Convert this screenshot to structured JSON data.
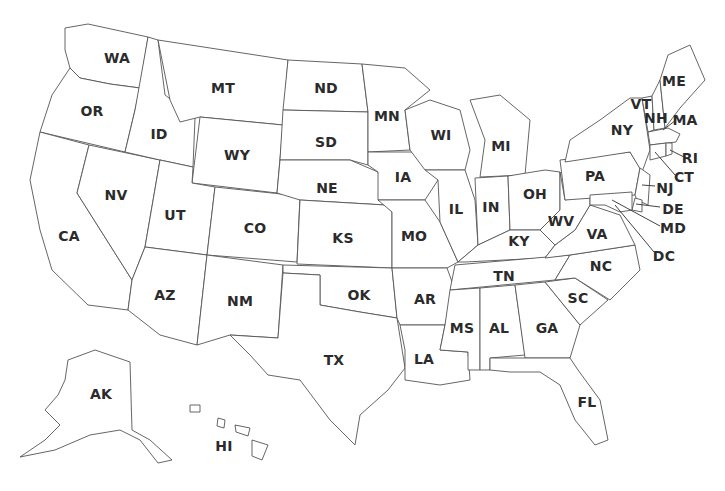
{
  "map": {
    "title": "United States",
    "colors": {
      "fill": "#ffffff",
      "stroke": "#555555",
      "label": "#2b2b2b"
    },
    "states": [
      {
        "abbr": "WA",
        "x": 117,
        "y": 58
      },
      {
        "abbr": "OR",
        "x": 92,
        "y": 111
      },
      {
        "abbr": "CA",
        "x": 69,
        "y": 236
      },
      {
        "abbr": "NV",
        "x": 116,
        "y": 195
      },
      {
        "abbr": "ID",
        "x": 159,
        "y": 134
      },
      {
        "abbr": "MT",
        "x": 223,
        "y": 88
      },
      {
        "abbr": "WY",
        "x": 237,
        "y": 155
      },
      {
        "abbr": "UT",
        "x": 175,
        "y": 215
      },
      {
        "abbr": "CO",
        "x": 255,
        "y": 228
      },
      {
        "abbr": "AZ",
        "x": 165,
        "y": 295
      },
      {
        "abbr": "NM",
        "x": 240,
        "y": 301
      },
      {
        "abbr": "ND",
        "x": 326,
        "y": 88
      },
      {
        "abbr": "SD",
        "x": 326,
        "y": 142
      },
      {
        "abbr": "NE",
        "x": 327,
        "y": 188
      },
      {
        "abbr": "KS",
        "x": 343,
        "y": 238
      },
      {
        "abbr": "OK",
        "x": 359,
        "y": 295
      },
      {
        "abbr": "TX",
        "x": 334,
        "y": 360
      },
      {
        "abbr": "MN",
        "x": 387,
        "y": 116
      },
      {
        "abbr": "IA",
        "x": 403,
        "y": 177
      },
      {
        "abbr": "MO",
        "x": 414,
        "y": 236
      },
      {
        "abbr": "AR",
        "x": 425,
        "y": 299
      },
      {
        "abbr": "LA",
        "x": 424,
        "y": 359
      },
      {
        "abbr": "WI",
        "x": 441,
        "y": 135
      },
      {
        "abbr": "IL",
        "x": 456,
        "y": 209
      },
      {
        "abbr": "MI",
        "x": 501,
        "y": 146
      },
      {
        "abbr": "IN",
        "x": 491,
        "y": 207
      },
      {
        "abbr": "OH",
        "x": 535,
        "y": 194
      },
      {
        "abbr": "KY",
        "x": 519,
        "y": 241
      },
      {
        "abbr": "TN",
        "x": 504,
        "y": 276
      },
      {
        "abbr": "MS",
        "x": 462,
        "y": 328
      },
      {
        "abbr": "AL",
        "x": 499,
        "y": 328
      },
      {
        "abbr": "GA",
        "x": 547,
        "y": 328
      },
      {
        "abbr": "FL",
        "x": 587,
        "y": 402
      },
      {
        "abbr": "SC",
        "x": 578,
        "y": 298
      },
      {
        "abbr": "NC",
        "x": 601,
        "y": 266
      },
      {
        "abbr": "VA",
        "x": 597,
        "y": 234
      },
      {
        "abbr": "WV",
        "x": 561,
        "y": 221
      },
      {
        "abbr": "PA",
        "x": 595,
        "y": 176
      },
      {
        "abbr": "NY",
        "x": 622,
        "y": 130
      },
      {
        "abbr": "VT",
        "x": 641,
        "y": 104
      },
      {
        "abbr": "NH",
        "x": 656,
        "y": 118
      },
      {
        "abbr": "ME",
        "x": 674,
        "y": 81
      },
      {
        "abbr": "MA",
        "x": 685,
        "y": 120
      },
      {
        "abbr": "RI",
        "x": 690,
        "y": 158
      },
      {
        "abbr": "CT",
        "x": 684,
        "y": 177
      },
      {
        "abbr": "NJ",
        "x": 665,
        "y": 188
      },
      {
        "abbr": "DE",
        "x": 673,
        "y": 209
      },
      {
        "abbr": "MD",
        "x": 673,
        "y": 228
      },
      {
        "abbr": "DC",
        "x": 664,
        "y": 256
      },
      {
        "abbr": "AK",
        "x": 101,
        "y": 394
      },
      {
        "abbr": "HI",
        "x": 224,
        "y": 446
      }
    ]
  }
}
